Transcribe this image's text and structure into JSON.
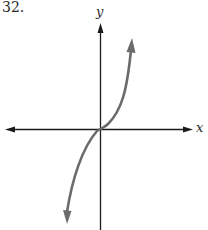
{
  "problem": {
    "number": "32."
  },
  "axes": {
    "x_label": "x",
    "y_label": "y"
  },
  "colors": {
    "axis": "#1a1a1a",
    "curve": "#6b6b6b"
  },
  "curve": {
    "description": "cubic-like curve through origin, increasing, arrows at both ends"
  }
}
